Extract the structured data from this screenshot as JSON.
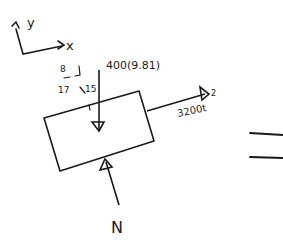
{
  "diagram": {
    "type": "free-body-diagram",
    "axes": {
      "y_label": "y",
      "x_label": "x"
    },
    "forces": {
      "weight_label": "400(9.81)",
      "applied_label": "3200t",
      "applied_exponent": "2",
      "normal_label": "N"
    },
    "angle": {
      "top": "8",
      "left": "17",
      "right": "15"
    },
    "equals_sign": "="
  },
  "colors": {
    "ink": "#1a1a1a",
    "background": "#ffffff"
  }
}
